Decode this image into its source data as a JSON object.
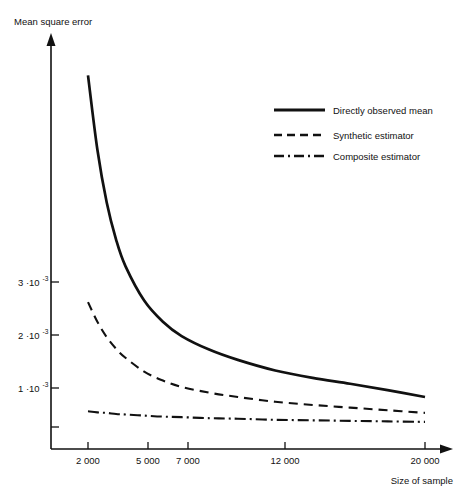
{
  "chart_data": {
    "type": "line",
    "title": "",
    "subtitle": "",
    "xlabel": "Size of sample",
    "ylabel": "Mean square error",
    "grid": false,
    "legend_position": "upper right",
    "xlim": [
      1200,
      21500
    ],
    "ylim": [
      0.00015,
      0.0075
    ],
    "x_ticks": [
      2000,
      5000,
      7000,
      12000,
      20000
    ],
    "x_tick_labels": [
      "2 000",
      "5 000",
      "7 000",
      "12 000",
      "20 000"
    ],
    "y_ticks": [
      0.001,
      0.002,
      0.003
    ],
    "y_tick_labels": [
      "1 ·10",
      "2 ·10",
      "3 ·10"
    ],
    "y_tick_exponent": "-3",
    "y_unlabeled_ticks": [
      0.0005
    ],
    "x": [
      2000,
      2500,
      3000,
      3500,
      4000,
      5000,
      6000,
      7000,
      8500,
      10000,
      12000,
      14000,
      16000,
      18000,
      20000
    ],
    "series": [
      {
        "name": "Directly observed mean",
        "style": "solid",
        "color": "#111111",
        "values": [
          0.0069,
          0.0055,
          0.0045,
          0.0038,
          0.0033,
          0.00265,
          0.00225,
          0.00198,
          0.00172,
          0.00153,
          0.00133,
          0.00119,
          0.00108,
          0.00096,
          0.00083
        ]
      },
      {
        "name": "Synthetic estimator",
        "style": "dashed",
        "color": "#111111",
        "values": [
          0.00262,
          0.00225,
          0.00196,
          0.00174,
          0.00157,
          0.00131,
          0.00114,
          0.00102,
          0.00091,
          0.00083,
          0.00074,
          0.00068,
          0.00063,
          0.00058,
          0.00053
        ]
      },
      {
        "name": "Composite estimator",
        "style": "dashdot",
        "color": "#111111",
        "values": [
          0.00056,
          0.00054,
          0.00053,
          0.00051,
          0.0005,
          0.00048,
          0.00046,
          0.00045,
          0.00043,
          0.00042,
          0.0004,
          0.00039,
          0.00038,
          0.00037,
          0.00036
        ]
      }
    ]
  },
  "axes": {
    "y_axis_label": "Mean square error",
    "x_axis_label": "Size of sample",
    "y_tick_labels": [
      {
        "mantissa": "3 ·10",
        "exponent": "-3"
      },
      {
        "mantissa": "2 ·10",
        "exponent": "-3"
      },
      {
        "mantissa": "1 ·10",
        "exponent": "-3"
      }
    ],
    "x_tick_labels": [
      "2 000",
      "5 000",
      "7 000",
      "12 000",
      "20 000"
    ]
  },
  "legend": {
    "items": [
      {
        "label": "Directly observed mean",
        "style": "solid"
      },
      {
        "label": "Synthetic estimator",
        "style": "dashed"
      },
      {
        "label": "Composite estimator",
        "style": "dash-dot"
      }
    ]
  }
}
